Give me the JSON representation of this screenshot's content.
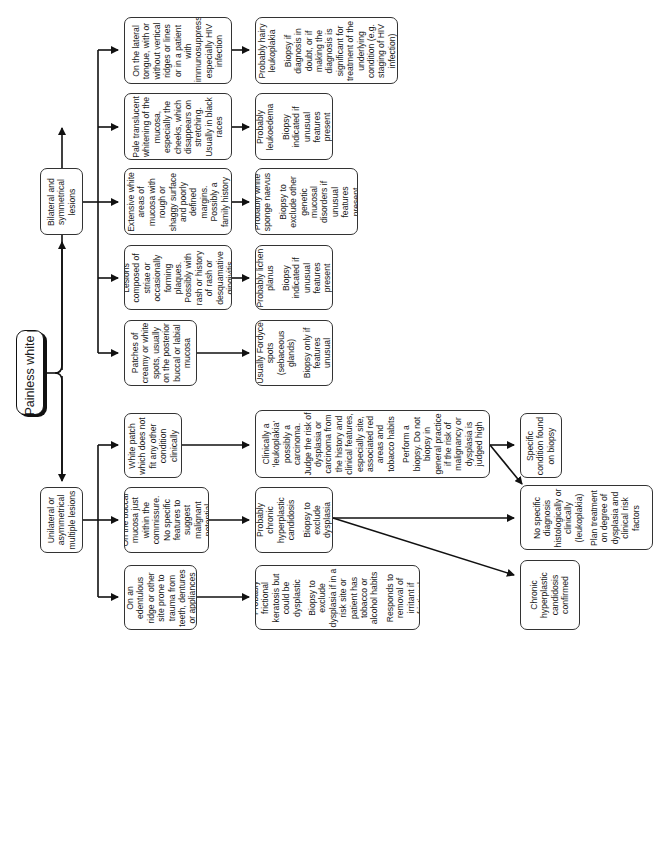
{
  "title": "Painless white patches",
  "branches": {
    "bilateral": "Bilateral and symmetrical lesions",
    "unilateral": "Unilateral or asymmetrical multiple lesions"
  },
  "bilateral_findings": [
    {
      "finding": "On the lateral tongue, with or without vertical ridges or lines or in a patient with immunosuppression, especially HIV infection",
      "diagnosis": [
        "Probably hairy leukoplakia",
        "Biopsy if diagnosis in doubt, or if making the diagnosis is significant for treatment of the underlying condition (e.g. staging of HIV infection)"
      ]
    },
    {
      "finding": "Pale translucent whitening of the mucosa, especially the cheeks, which disappears on stretching. Usually in black races",
      "diagnosis": [
        "Probably leukoedema",
        "Biopsy indicated if unusual features present"
      ]
    },
    {
      "finding": "Extensive white areas of mucosa with rough or shaggy surface and poorly defined margins. Possibly a family history",
      "diagnosis": [
        "Probably white sponge naevus",
        "Biopsy to exclude other genetic mucosal disorders if unusual features present"
      ]
    },
    {
      "finding": "Lesions composed of striae or occasionally forming plaques. Possibly with rash or history of rash or desquamative gingivitis",
      "diagnosis": [
        "Probably lichen planus",
        "Biopsy indicated if unusual features present"
      ]
    },
    {
      "finding": "Patches of creamy or white spots, usually on the posterior buccal or labial mucosa",
      "diagnosis": [
        "Usually Fordyce spots (sebaceous glands)",
        "Biopsy only if features unusual"
      ]
    }
  ],
  "unilateral_findings": [
    {
      "finding": "White patch which does not fit any other condition clinically",
      "diagnosis": [
        "Clinically a 'leukoplakia' possibly a carcinoma. Judge the risk of dysplasia or carcinoma from the history and clinical features, especially site, associated red areas and tobacco habits",
        "Perform a biopsy. Do not biopsy in general practice if the risk of malignancy or dysplasia is judged high"
      ]
    },
    {
      "finding": "On the buccal mucosa just within the commissure. No specific features to suggest malignant potential",
      "diagnosis": [
        "Probably chronic hyperplastic candidosis",
        "Biopsy to exclude dysplasia"
      ]
    },
    {
      "finding": "On an edentulous ridge or other site prone to trauma from teeth, dentures or appliances",
      "diagnosis": [
        "Probably frictional keratosis but could be dysplastic",
        "Biopsy to exclude dysplasia if in a risk site or patient has tobacco or alcohol habits",
        "Responds to removal of irritant if frictional"
      ]
    }
  ],
  "outcomes": {
    "specific": "Specific condition found on biopsy",
    "no_specific": [
      "No specific diagnosis histologically or clinically (leukoplakia)",
      "Plan treatment on degree of dysplasia and clinical risk factors"
    ],
    "chronic_confirmed": "Chronic hyperplastic candidosis confirmed"
  }
}
